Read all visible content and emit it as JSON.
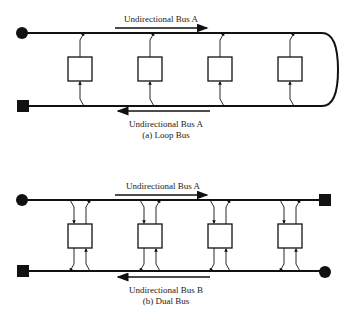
{
  "diagrams": {
    "loop": {
      "top_label": "Undirectional Bus A",
      "bottom_label": "Undirectional Bus A",
      "caption": "(a) Loop Bus",
      "node_count": 4
    },
    "dual": {
      "top_label": "Undirectional Bus A",
      "bottom_label": "Undirectional Bus B",
      "caption": "(b) Dual Bus",
      "node_count": 4
    }
  },
  "colors": {
    "line": "#111111",
    "background": "#ffffff"
  }
}
